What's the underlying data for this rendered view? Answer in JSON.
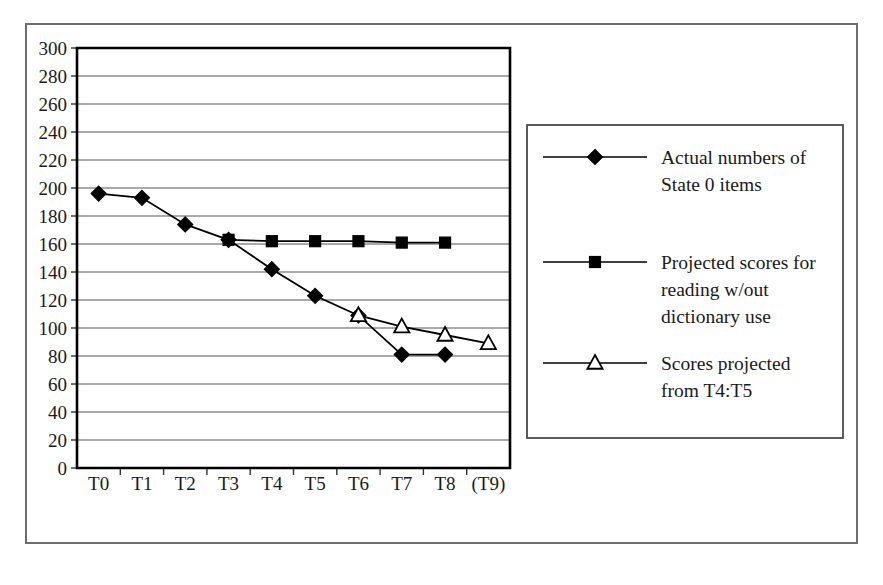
{
  "chart_data": {
    "type": "line",
    "title": "",
    "xlabel": "",
    "ylabel": "",
    "categories": [
      "T0",
      "T1",
      "T2",
      "T3",
      "T4",
      "T5",
      "T6",
      "T7",
      "T8",
      "(T9)"
    ],
    "ylim": [
      0,
      300
    ],
    "ytick_step": 20,
    "yticks": [
      0,
      20,
      40,
      60,
      80,
      100,
      120,
      140,
      160,
      180,
      200,
      220,
      240,
      260,
      280,
      300
    ],
    "grid": true,
    "legend_position": "right",
    "series": [
      {
        "name": "Actual numbers of State 0 items",
        "legend_lines": [
          "Actual numbers of",
          "State 0 items"
        ],
        "marker": "diamond-filled",
        "color": "#000000",
        "x": [
          "T0",
          "T1",
          "T2",
          "T3",
          "T4",
          "T5",
          "T6",
          "T7",
          "T8"
        ],
        "values": [
          196,
          193,
          174,
          163,
          142,
          123,
          109,
          81,
          81
        ]
      },
      {
        "name": "Projected scores for reading w/out dictionary use",
        "legend_lines": [
          "Projected scores for",
          "reading w/out",
          "dictionary use"
        ],
        "marker": "square-filled",
        "color": "#000000",
        "x": [
          "T3",
          "T4",
          "T5",
          "T6",
          "T7",
          "T8"
        ],
        "values": [
          163,
          162,
          162,
          162,
          161,
          161
        ]
      },
      {
        "name": "Scores projected from T4:T5",
        "legend_lines": [
          "Scores projected",
          "from T4:T5"
        ],
        "marker": "triangle-open",
        "color": "#000000",
        "x": [
          "T6",
          "T7",
          "T8",
          "(T9)"
        ],
        "values": [
          109,
          101,
          95,
          89
        ]
      }
    ]
  },
  "figure": {
    "frame_color": "#6e6e6e",
    "background_color": "#ffffff",
    "axis_color": "#000000",
    "gridline_color": "#555555"
  }
}
